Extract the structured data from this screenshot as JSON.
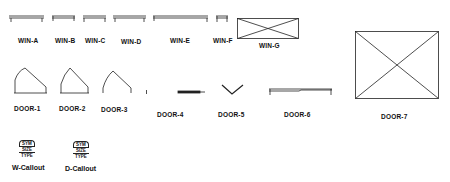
{
  "windows": [
    {
      "label": "WIN-A"
    },
    {
      "label": "WIN-B"
    },
    {
      "label": "WIN-C"
    },
    {
      "label": "WIN-D"
    },
    {
      "label": "WIN-E"
    },
    {
      "label": "WIN-F"
    },
    {
      "label": "WIN-G"
    }
  ],
  "doors": [
    {
      "label": "DOOR-1"
    },
    {
      "label": "DOOR-2"
    },
    {
      "label": "DOOR-3"
    },
    {
      "label": "DOOR-4"
    },
    {
      "label": "DOOR-5"
    },
    {
      "label": "DOOR-6"
    },
    {
      "label": "DOOR-7"
    }
  ],
  "callouts": [
    {
      "label": "W-Callout",
      "lines": [
        "SYM",
        "SIZE",
        "TYPE"
      ]
    },
    {
      "label": "D-Callout",
      "lines": [
        "SYM",
        "SIZE",
        "TYPE"
      ]
    }
  ]
}
